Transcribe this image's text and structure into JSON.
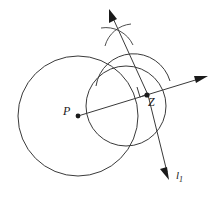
{
  "figure": {
    "type": "geometry-diagram",
    "canvas": {
      "width": 222,
      "height": 198,
      "background": "#ffffff"
    },
    "stroke_color": "#3a3a3a",
    "label_color": "#1a1a1a",
    "labels": {
      "center_point": "P",
      "tangent_point": "Z",
      "line_name": "l",
      "line_subscript": "1"
    },
    "points": [
      {
        "name": "P",
        "role": "circle-center",
        "x": 78,
        "y": 116
      },
      {
        "name": "Z",
        "role": "point-on-circle",
        "x": 148,
        "y": 95
      },
      {
        "name": "arc-intersection",
        "role": "construction-cross",
        "x": 117,
        "y": 36
      }
    ],
    "circles": [
      {
        "name": "main-circle",
        "center": [
          78,
          116
        ],
        "radius": 60
      },
      {
        "name": "construction-circle",
        "center": [
          126,
          106
        ],
        "radius": 40
      }
    ],
    "arcs": [
      {
        "name": "semicircle-arc",
        "center": [
          133,
          96
        ],
        "radius": 38,
        "start_deg": 195,
        "end_deg": 345
      }
    ],
    "rays": [
      {
        "name": "ray-PZ",
        "from": [
          78,
          116
        ],
        "to": [
          207,
          77
        ],
        "arrow": true
      },
      {
        "name": "ray-perpendicular-up",
        "from": [
          148,
          95
        ],
        "to": [
          110,
          11
        ],
        "arrow": true
      },
      {
        "name": "ray-perpendicular-down",
        "from": [
          148,
          95
        ],
        "to": [
          170,
          180
        ],
        "arrow": true
      }
    ],
    "right_angle_marker": {
      "at": [
        148,
        95
      ],
      "size": 11
    }
  }
}
